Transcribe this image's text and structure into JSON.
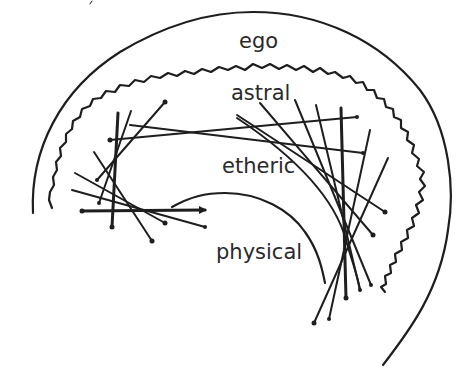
{
  "diagram": {
    "labels": {
      "ego": "ego",
      "astral": "astral",
      "etheric": "etheric",
      "physical": "physical"
    },
    "layers": [
      {
        "name": "ego",
        "boundary": "outer smooth arc"
      },
      {
        "name": "astral",
        "boundary": "wavy arc"
      },
      {
        "name": "etheric",
        "boundary": "crossing lines"
      },
      {
        "name": "physical",
        "boundary": "inner smooth arc"
      }
    ],
    "colors": {
      "stroke": "#1e1e1e",
      "text": "#2a2a2a",
      "background": "#ffffff"
    }
  }
}
